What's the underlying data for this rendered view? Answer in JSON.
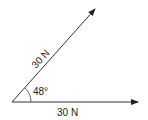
{
  "diagram": {
    "type": "vector-diagram",
    "vectors": [
      {
        "id": "horizontal",
        "magnitude_label": "30 N",
        "angle_deg": 0
      },
      {
        "id": "diagonal",
        "magnitude_label": "30 N",
        "angle_deg": 48
      }
    ],
    "angle_label": "48°",
    "line_color": "#333333"
  }
}
